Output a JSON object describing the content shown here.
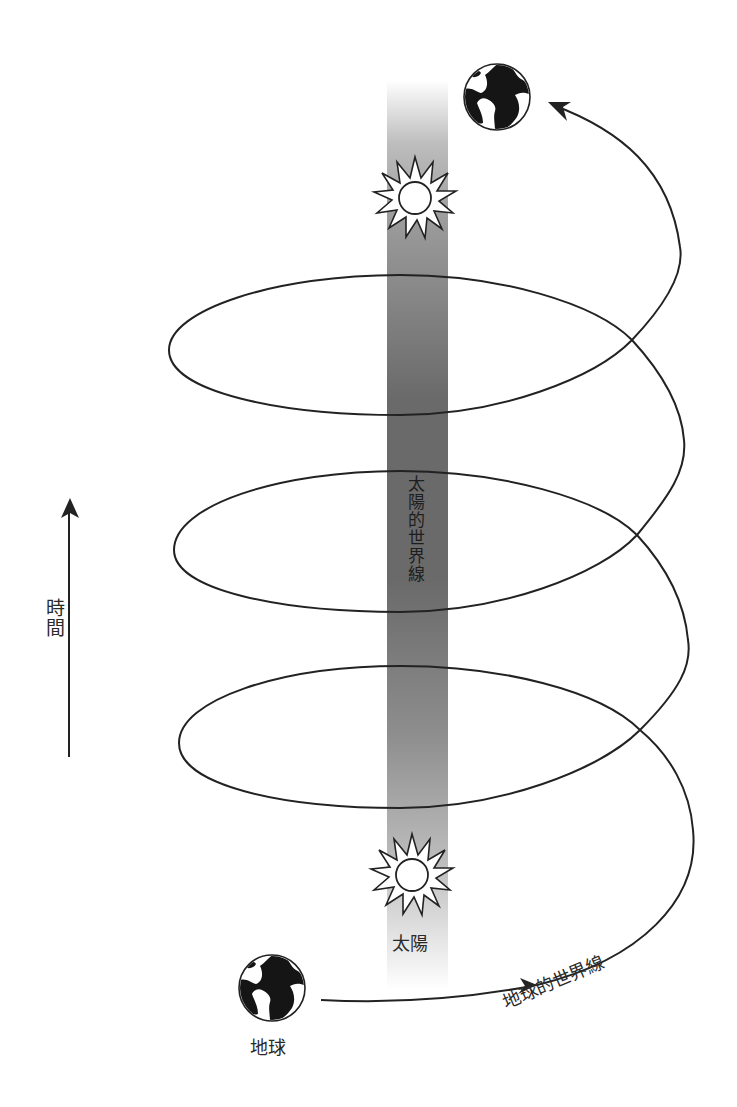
{
  "diagram": {
    "labels": {
      "time_axis": "時間",
      "sun_worldline": "太陽的世界線",
      "sun": "太陽",
      "earth": "地球",
      "earth_worldline": "地球的世界線"
    },
    "icons": {
      "sun_top": "sun-icon",
      "sun_bottom": "sun-icon",
      "earth_top": "earth-globe-icon",
      "earth_bottom": "earth-globe-icon",
      "time_arrow": "arrow-up-icon"
    },
    "colors": {
      "line": "#222222",
      "worldline_bar": "#6e6e6e",
      "background": "#ffffff"
    },
    "elements": {
      "time_arrow": {
        "x": 69,
        "y_start": 757,
        "y_end": 498
      },
      "sun_bar": {
        "x": 387,
        "width": 61,
        "y_top": 80,
        "y_bottom": 990
      },
      "sun_top": {
        "cx": 415,
        "cy": 198
      },
      "sun_bottom": {
        "cx": 412,
        "cy": 875
      },
      "earth_top": {
        "cx": 497,
        "cy": 97,
        "r": 34
      },
      "earth_bottom": {
        "cx": 272,
        "cy": 988,
        "r": 33
      },
      "spiral_loops": 3
    }
  }
}
